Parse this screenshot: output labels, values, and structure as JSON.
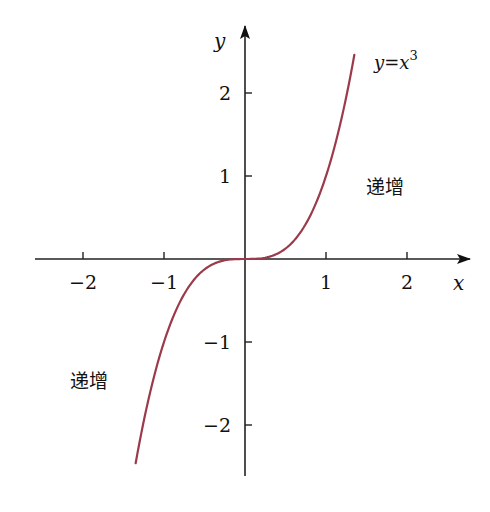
{
  "chart_data": {
    "type": "line",
    "title": "",
    "xlabel": "x",
    "ylabel": "y",
    "function": "y=x^3",
    "xlim": [
      -2.5,
      2.8
    ],
    "ylim": [
      -2.6,
      2.6
    ],
    "x_ticks": [
      -2,
      -1,
      1,
      2
    ],
    "x_tick_labels": [
      "−2",
      "−1",
      "1",
      "2"
    ],
    "y_ticks": [
      2,
      1,
      -1,
      -2
    ],
    "y_tick_labels": [
      "2",
      "1",
      "−1",
      "−2"
    ],
    "grid": false,
    "series": [
      {
        "name": "y=x³",
        "color": "#9b3a4a",
        "x": [
          -1.35,
          -1.2,
          -1.0,
          -0.8,
          -0.6,
          -0.4,
          -0.2,
          0,
          0.2,
          0.4,
          0.6,
          0.8,
          1.0,
          1.2,
          1.35
        ],
        "y": [
          -2.46,
          -1.73,
          -1.0,
          -0.51,
          -0.22,
          -0.06,
          -0.01,
          0,
          0.01,
          0.06,
          0.22,
          0.51,
          1.0,
          1.73,
          2.46
        ]
      }
    ],
    "annotations": [
      {
        "text": "递增",
        "near": [
          1.6,
          0.9
        ]
      },
      {
        "text": "递增",
        "near": [
          -2.0,
          -1.45
        ]
      }
    ],
    "curve_label": {
      "prefix": "y=x",
      "sup": "3"
    }
  }
}
